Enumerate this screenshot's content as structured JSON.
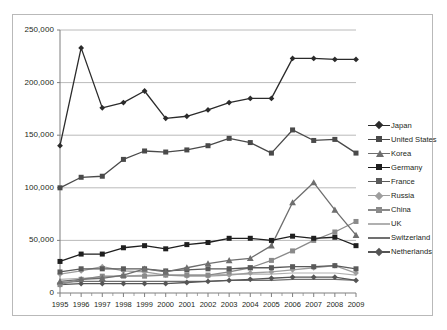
{
  "chart_data": {
    "type": "line",
    "title": "",
    "xlabel": "",
    "ylabel": "",
    "x": [
      1995,
      1996,
      1997,
      1998,
      1999,
      2000,
      2001,
      2002,
      2003,
      2004,
      2005,
      2006,
      2007,
      2008,
      2009
    ],
    "categories": [
      "1995",
      "1996",
      "1997",
      "1998",
      "1999",
      "2000",
      "2001",
      "2002",
      "2003",
      "2004",
      "2005",
      "2006",
      "2007",
      "2008",
      "2009"
    ],
    "ylim": [
      0,
      250000
    ],
    "yticks": [
      0,
      50000,
      100000,
      150000,
      200000,
      250000
    ],
    "ytick_labels": [
      "0",
      "50,000",
      "100,000",
      "150,000",
      "200,000",
      "250,000"
    ],
    "grid": "horizontal",
    "legend_position": "right",
    "series": [
      {
        "name": "Japan",
        "marker": "diamond",
        "color": "#2b2b2b",
        "values": [
          140000,
          233000,
          176000,
          181000,
          192000,
          166000,
          168000,
          174000,
          181000,
          185000,
          185000,
          223000,
          223000,
          222000,
          222000
        ]
      },
      {
        "name": "United States",
        "marker": "square",
        "color": "#4a4a4a",
        "values": [
          100000,
          110000,
          111000,
          127000,
          135000,
          134000,
          136000,
          140000,
          147000,
          143000,
          133000,
          155000,
          145000,
          146000,
          133000
        ]
      },
      {
        "name": "Korea",
        "marker": "triangle",
        "color": "#6e6e6e",
        "values": [
          11000,
          13000,
          14000,
          17000,
          23000,
          20000,
          24000,
          28000,
          31000,
          33000,
          45000,
          86000,
          105000,
          79000,
          55000
        ]
      },
      {
        "name": "Germany",
        "marker": "square",
        "color": "#1f1f1f",
        "values": [
          30000,
          37000,
          37000,
          43000,
          45000,
          42000,
          46000,
          48000,
          52000,
          52000,
          50000,
          54000,
          52000,
          53000,
          45000
        ]
      },
      {
        "name": "France",
        "marker": "square",
        "color": "#5a5a5a",
        "values": [
          20000,
          23000,
          23000,
          23000,
          23000,
          21000,
          22000,
          23000,
          23000,
          24000,
          24000,
          25000,
          25000,
          26000,
          23000
        ]
      },
      {
        "name": "Russia",
        "marker": "diamond",
        "color": "#9e9e9e",
        "values": [
          18000,
          21000,
          25000,
          21000,
          20000,
          17000,
          16000,
          16000,
          17000,
          19000,
          20000,
          22000,
          24000,
          26000,
          19000
        ]
      },
      {
        "name": "China",
        "marker": "square",
        "color": "#8a8a8a",
        "values": [
          8000,
          13000,
          16000,
          16000,
          16000,
          17000,
          17000,
          17000,
          20000,
          24000,
          31000,
          40000,
          50000,
          58000,
          68000
        ]
      },
      {
        "name": "UK",
        "marker": "none",
        "color": "#b0b0b0",
        "values": [
          13000,
          14000,
          15000,
          16000,
          17000,
          17000,
          17000,
          17000,
          18000,
          18000,
          18000,
          19000,
          19000,
          19000,
          17000
        ]
      },
      {
        "name": "Switzerland",
        "marker": "none",
        "color": "#707070",
        "values": [
          10000,
          11000,
          11000,
          11000,
          11000,
          11000,
          11000,
          11000,
          12000,
          12000,
          12000,
          13000,
          13000,
          13000,
          12000
        ]
      },
      {
        "name": "Netherlands",
        "marker": "diamond",
        "color": "#555555",
        "values": [
          8000,
          9000,
          9000,
          9000,
          9000,
          9000,
          10000,
          11000,
          12000,
          13000,
          14000,
          15000,
          15000,
          15000,
          12000
        ]
      }
    ]
  },
  "legend": {
    "items": [
      {
        "label": "Japan"
      },
      {
        "label": "United States"
      },
      {
        "label": "Korea"
      },
      {
        "label": "Germany"
      },
      {
        "label": "France"
      },
      {
        "label": "Russia"
      },
      {
        "label": "China"
      },
      {
        "label": "UK"
      },
      {
        "label": "Switzerland"
      },
      {
        "label": "Netherlands"
      }
    ]
  },
  "colors": {
    "axis": "#7f7f7f",
    "grid": "#a8a8a8",
    "frame": "#b9b9b9",
    "text": "#231f20"
  }
}
